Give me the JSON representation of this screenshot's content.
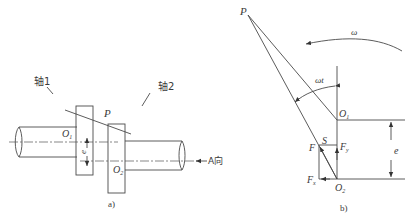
{
  "figure_a": {
    "caption": "a)",
    "shaft1_label": "轴1",
    "shaft2_label": "轴2",
    "point_p": "P",
    "center_o1": "O",
    "center_o1_sub": "1",
    "center_o2": "O",
    "center_o2_sub": "2",
    "eccentricity": "e",
    "view_label": "A向"
  },
  "figure_b": {
    "caption": "b)",
    "point_p": "P",
    "omega": "ω",
    "angle": "ωt",
    "center_o1": "O",
    "center_o1_sub": "1",
    "center_o2": "O",
    "center_o2_sub": "2",
    "force_f": "F",
    "point_s": "S",
    "force_fy": "F",
    "force_fy_sub": "y",
    "force_fx": "F",
    "force_fx_sub": "x",
    "eccentricity": "e"
  },
  "colors": {
    "line": "#4a4a4a",
    "text": "#3a3a3a",
    "background": "#ffffff"
  }
}
